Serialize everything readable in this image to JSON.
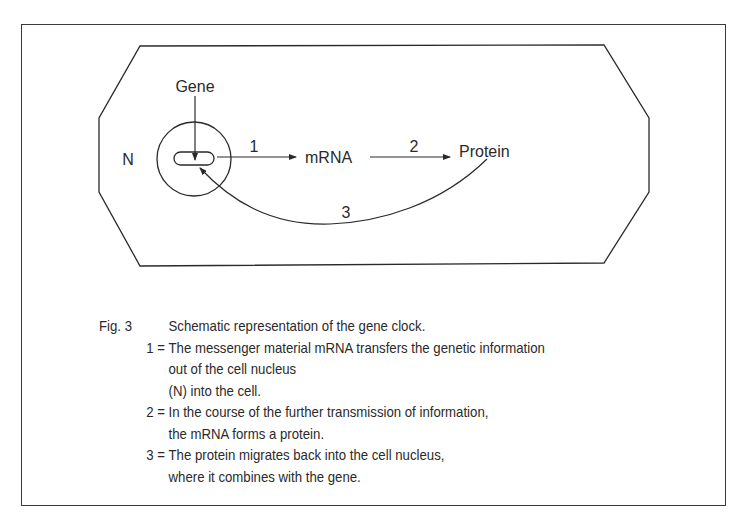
{
  "diagram": {
    "labels": {
      "gene": "Gene",
      "nucleus": "N",
      "mrna": "mRNA",
      "protein": "Protein",
      "step1": "1",
      "step2": "2",
      "step3": "3"
    },
    "colors": {
      "stroke": "#2a2a2a",
      "background": "#ffffff"
    }
  },
  "caption": {
    "fig_label": "Fig. 3",
    "title": "Schematic representation of the gene clock.",
    "items": [
      {
        "num": "1 =",
        "lines": [
          "The messenger material mRNA transfers the genetic information",
          "out of the cell nucleus",
          "(N) into the cell."
        ]
      },
      {
        "num": "2 =",
        "lines": [
          "In the course of the further transmission of information,",
          "the mRNA forms a protein."
        ]
      },
      {
        "num": "3 =",
        "lines": [
          "The protein migrates back into the cell nucleus,",
          "where it combines with the gene."
        ]
      }
    ]
  }
}
